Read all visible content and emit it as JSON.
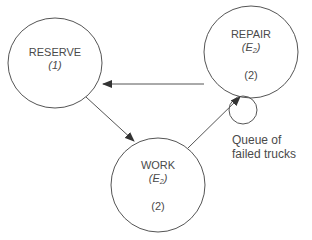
{
  "diagram": {
    "type": "state-transition",
    "nodes": [
      {
        "id": "reserve",
        "title": "RESERVE",
        "dist": "",
        "count": "(1)"
      },
      {
        "id": "repair",
        "title": "REPAIR",
        "dist_base": "E",
        "dist_sub": "2",
        "count": "(2)"
      },
      {
        "id": "work",
        "title": "WORK",
        "dist_base": "E",
        "dist_sub": "2",
        "count": "(2)"
      }
    ],
    "queue": {
      "label_line1": "Queue of",
      "label_line2": "failed trucks"
    },
    "edges": [
      {
        "from": "repair",
        "to": "reserve"
      },
      {
        "from": "reserve",
        "to": "work"
      },
      {
        "from": "work",
        "to": "repair"
      }
    ],
    "colors": {
      "stroke": "#555555",
      "text": "#4a4a4a",
      "background": "#ffffff"
    }
  }
}
